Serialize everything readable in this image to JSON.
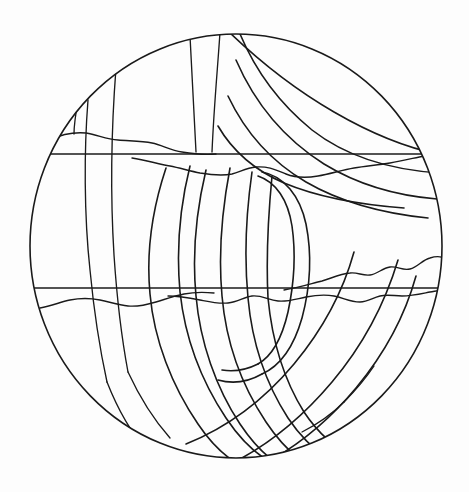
{
  "document": {
    "title": "Coloring Page Line Art",
    "subject": "stylized-sphere-with-rings",
    "background_color": "#fdfdfd",
    "line_color": "#1a1a1a",
    "canvas": {
      "width": 469,
      "height": 492
    }
  },
  "artwork": {
    "alt_text": "Black outline drawing of a sphere crossed by two straight horizontal lines, wavy terrain lines, diagonal banding across the upper right, and a cluster of vertical interlocking ring bands through the centre.",
    "sphere": {
      "name": "sphere-outline",
      "center_x": 236,
      "center_y": 246,
      "radius_x": 207,
      "radius_y": 213
    },
    "horizontal_lines": [
      {
        "name": "upper-equator-line",
        "y": 154,
        "x_start": 34,
        "x_end": 440
      },
      {
        "name": "lower-equator-line",
        "y": 288,
        "x_start": 31,
        "x_end": 443
      }
    ],
    "elements": [
      {
        "name": "upper-wavy-terrain-line",
        "type": "wavy-line"
      },
      {
        "name": "upper-wavy-terrain-line-lower",
        "type": "wavy-line"
      },
      {
        "name": "lower-wavy-terrain-line-left",
        "type": "wavy-line"
      },
      {
        "name": "lower-wavy-terrain-line-right",
        "type": "wavy-line"
      },
      {
        "name": "right-wavy-ridge-line",
        "type": "wavy-line"
      },
      {
        "name": "diagonal-band-outer",
        "type": "arc-band"
      },
      {
        "name": "diagonal-band-middle",
        "type": "arc-band"
      },
      {
        "name": "diagonal-band-inner",
        "type": "arc-band"
      },
      {
        "name": "ring-band-one",
        "type": "vertical-ring"
      },
      {
        "name": "ring-band-two",
        "type": "vertical-ring"
      },
      {
        "name": "ring-band-three",
        "type": "vertical-ring"
      },
      {
        "name": "ring-band-four",
        "type": "vertical-ring"
      },
      {
        "name": "left-meridian-one",
        "type": "meridian"
      },
      {
        "name": "left-meridian-two",
        "type": "meridian"
      },
      {
        "name": "top-meridian-one",
        "type": "meridian"
      },
      {
        "name": "top-meridian-two",
        "type": "meridian"
      },
      {
        "name": "top-left-wedge",
        "type": "wedge"
      }
    ]
  }
}
